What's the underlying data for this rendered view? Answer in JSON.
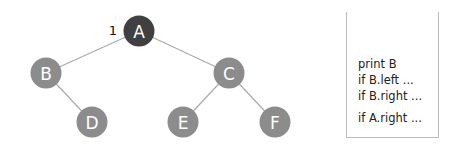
{
  "tree": {
    "nodes": [
      {
        "id": "A",
        "label": "A",
        "x": 139,
        "y": 31,
        "color": "#404040"
      },
      {
        "id": "B",
        "label": "B",
        "x": 46,
        "y": 73,
        "color": "#8c8c8c"
      },
      {
        "id": "C",
        "label": "C",
        "x": 229,
        "y": 73,
        "color": "#8c8c8c"
      },
      {
        "id": "D",
        "label": "D",
        "x": 92,
        "y": 122,
        "color": "#8c8c8c"
      },
      {
        "id": "E",
        "label": "E",
        "x": 183,
        "y": 122,
        "color": "#8c8c8c"
      },
      {
        "id": "F",
        "label": "F",
        "x": 275,
        "y": 122,
        "color": "#8c8c8c"
      }
    ],
    "edges": [
      [
        "A",
        "B"
      ],
      [
        "A",
        "C"
      ],
      [
        "B",
        "D"
      ],
      [
        "C",
        "E"
      ],
      [
        "C",
        "F"
      ]
    ],
    "step_label": "1"
  },
  "call_stack": {
    "lines": [
      "print B",
      "if B.left ...",
      "if B.right ...",
      "if A.right ..."
    ]
  }
}
